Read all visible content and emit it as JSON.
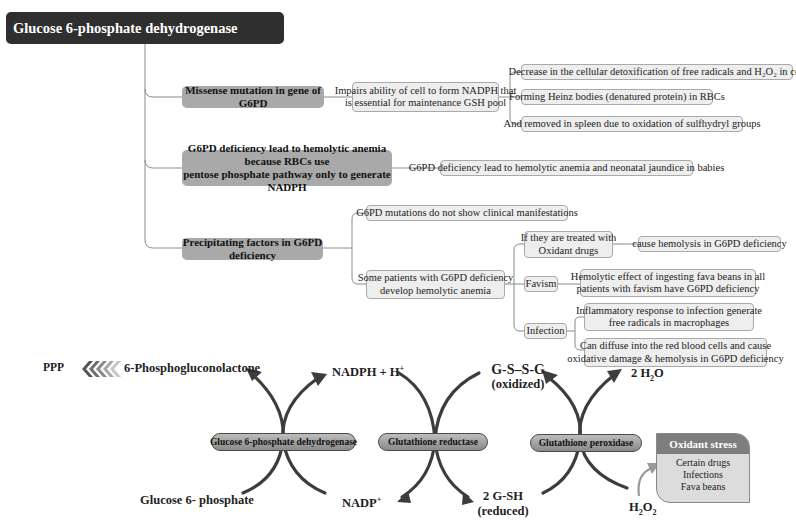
{
  "mindmap": {
    "root": "Glucose 6-phosphate dehydrogenase deficiency",
    "branches": [
      {
        "label": "Missense mutation in gene of G6PD",
        "child": "Impairs ability of cell to form NADPH that is essential for maintenance GSH pool",
        "child_lines": [
          "Impairs ability of cell to form NADPH that",
          "is essential for maintenance GSH pool"
        ],
        "effects": [
          "Decrease in the cellular detoxification of free radicals and H₂O₂ in cell",
          "Forming Heinz bodies (denatured protein) in RBCs",
          "And removed in spleen due to oxidation of sulfhydryl groups"
        ]
      },
      {
        "label_lines": [
          "G6PD deficiency lead to hemolytic anemia because RBCs use",
          "pentose phosphate pathway only to generate NADPH"
        ],
        "child": "G6PD deficiency lead to hemolytic anemia and neonatal jaundice in babies"
      },
      {
        "label": "Precipitating factors in G6PD deficiency",
        "children": [
          "G6PD mutations do not show clinical manifestations",
          "Some patients with G6PD deficiency develop hemolytic anemia"
        ],
        "children_lines": [
          [
            "G6PD mutations do not show clinical manifestations"
          ],
          [
            "Some patients with G6PD deficiency",
            "develop hemolytic anemia"
          ]
        ],
        "triggers": [
          {
            "label_lines": [
              "If they are treated with",
              "Oxidant drugs"
            ],
            "effect_lines": [
              "cause hemolysis in G6PD deficiency"
            ]
          },
          {
            "label_lines": [
              "Favism"
            ],
            "effect_lines": [
              "Hemolytic effect of ingesting fava beans in all",
              "patients with favism have G6PD deficiency"
            ]
          },
          {
            "label_lines": [
              "Infection"
            ],
            "effects": [
              [
                "Inflammatory response to infection generate",
                "free radicals in macrophages"
              ],
              [
                "Can diffuse into the red blood cells and cause",
                "oxidative damage & hemolysis in G6PD deficiency"
              ]
            ]
          }
        ]
      }
    ]
  },
  "pathway": {
    "ppp_label": "PPP",
    "ppp_arrow_colors": [
      "#555555",
      "#6e6e6e",
      "#8a8a8a",
      "#a8a8a8",
      "#c6c6c6"
    ],
    "enzymes": [
      "Glucose 6-phosphate dehydrogenase",
      "Glutathione reductase",
      "Glutathione peroxidase"
    ],
    "metabolites": {
      "phosphogluconolactone": "6-Phosphogluconolactone",
      "nadph": "NADPH + H",
      "nadph_sup": "+",
      "gssg": "G-S–S-G",
      "gssg_state": "(oxidized)",
      "water": "2 H",
      "water_sub": "2",
      "water_tail": "O",
      "g6p": "Glucose 6- phosphate",
      "nadp": "NADP",
      "nadp_sup": "+",
      "gsh": "2 G-SH",
      "gsh_state": "(reduced)",
      "h2o2_a": "H",
      "h2o2_sub1": "2",
      "h2o2_b": "O",
      "h2o2_sub2": "2"
    },
    "oxidant_stress": {
      "title": "Oxidant stress",
      "items": [
        "Certain drugs",
        "Infections",
        "Fava beans"
      ]
    }
  },
  "colors": {
    "root_bg": "#2f2f2f",
    "branch_bg": "#a9a9a9",
    "leaf_bg": "#eeeeee",
    "arrow": "#3d3d3d",
    "oxidant_header": "#7e7e7e"
  }
}
